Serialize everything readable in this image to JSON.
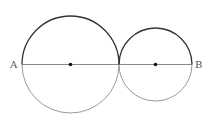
{
  "diagram": {
    "points": {
      "A": {
        "label": "A",
        "x": 22,
        "y": 64.5
      },
      "B": {
        "label": "B",
        "x": 192,
        "y": 64.5
      }
    },
    "circles": [
      {
        "name": "large-circle",
        "cx": 70.5,
        "cy": 64.5,
        "r": 48.5
      },
      {
        "name": "small-circle",
        "cx": 155.5,
        "cy": 64.5,
        "r": 36.5
      }
    ],
    "segment": {
      "from": "A",
      "to": "B"
    },
    "colors": {
      "upper_arc": "#333333",
      "lower_arc": "#9a9a9a",
      "segment": "#8a8a8a",
      "center_dot": "#111111",
      "label": "#555555"
    }
  }
}
